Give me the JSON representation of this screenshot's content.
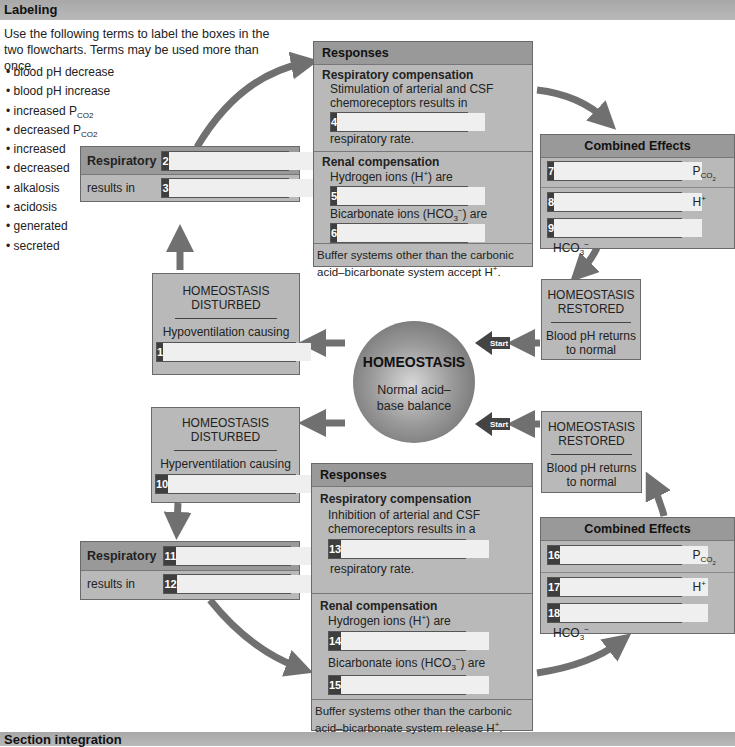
{
  "sections": {
    "labeling": "Labeling",
    "integration": "Section integration"
  },
  "intro": "Use the following terms to label the boxes in the two flowcharts. Terms may be used more than once.",
  "terms": [
    "blood pH decrease",
    "blood pH increase",
    "increased P",
    "decreased P",
    "increased",
    "decreased",
    "alkalosis",
    "acidosis",
    "generated",
    "secreted"
  ],
  "terms_sub": "CO2",
  "colors": {
    "box": "#b9b9b9",
    "header": "#999999",
    "num_bg": "#3e3e3e",
    "arrow": "#707070",
    "start_arrow": "#444444"
  },
  "center": {
    "title": "HOMEOSTASIS",
    "subtitle": "Normal acid–base balance"
  },
  "start_label": "Start",
  "top": {
    "disturbed": {
      "title1": "HOMEOSTASIS",
      "title2": "DISTURBED",
      "cause": "Hypoventilation causing",
      "num": "1"
    },
    "respiratory": {
      "label": "Respiratory",
      "num": "2",
      "results": "results in",
      "num2": "3"
    },
    "responses": {
      "header": "Responses",
      "resp_title": "Respiratory compensation",
      "resp_text": "Stimulation of arterial and CSF chemoreceptors results in",
      "num4": "4",
      "resp_tail": "respiratory rate.",
      "renal_title": "Renal compensation",
      "h_text": "Hydrogen ions (H",
      "h_tail": ") are",
      "num5": "5",
      "bic_text": "Bicarbonate ions (HCO",
      "bic_tail": ") are",
      "num6": "6",
      "buffer": "Buffer systems other than the carbonic acid–bicarbonate system accept H"
    },
    "combined": {
      "header": "Combined Effects",
      "rows": [
        {
          "num": "7",
          "label": "P",
          "sub": "CO2"
        },
        {
          "num": "8",
          "label": "H",
          "sup": "+"
        },
        {
          "num": "9",
          "label": "HCO",
          "sub": "3",
          "sup": "−"
        }
      ]
    },
    "restored": {
      "title1": "HOMEOSTASIS",
      "title2": "RESTORED",
      "text": "Blood pH returns to normal"
    }
  },
  "bottom": {
    "disturbed": {
      "title1": "HOMEOSTASIS",
      "title2": "DISTURBED",
      "cause": "Hyperventilation causing",
      "num": "10"
    },
    "respiratory": {
      "label": "Respiratory",
      "num": "11",
      "results": "results in",
      "num2": "12"
    },
    "responses": {
      "header": "Responses",
      "resp_title": "Respiratory compensation",
      "resp_text": "Inhibition of arterial and CSF chemoreceptors results in a",
      "num13": "13",
      "resp_tail": "respiratory rate.",
      "renal_title": "Renal compensation",
      "h_text": "Hydrogen ions (H",
      "h_tail": ") are",
      "num14": "14",
      "bic_text": "Bicarbonate ions (HCO",
      "bic_tail": ") are",
      "num15": "15",
      "buffer": "Buffer systems other than the carbonic acid–bicarbonate system release H"
    },
    "combined": {
      "header": "Combined Effects",
      "rows": [
        {
          "num": "16",
          "label": "P",
          "sub": "CO2"
        },
        {
          "num": "17",
          "label": "H",
          "sup": "+"
        },
        {
          "num": "18",
          "label": "HCO",
          "sub": "3",
          "sup": "−"
        }
      ]
    },
    "restored": {
      "title1": "HOMEOSTASIS",
      "title2": "RESTORED",
      "text": "Blood pH returns to normal"
    }
  },
  "symbols": {
    "plus": "+",
    "minus": "−",
    "three": "3",
    "period": "."
  }
}
